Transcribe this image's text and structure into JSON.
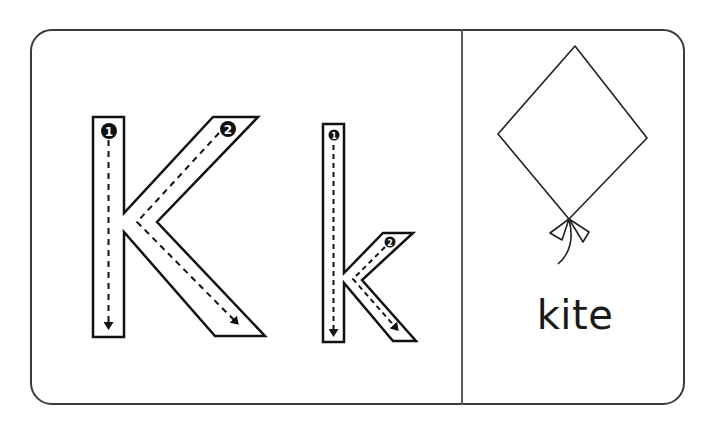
{
  "card": {
    "letters": {
      "uppercase": "K",
      "lowercase": "k"
    },
    "stroke_numbers": {
      "uppercase": [
        "1",
        "2"
      ],
      "lowercase": [
        "1",
        "2"
      ]
    },
    "picture": {
      "icon": "kite-icon",
      "word": "kite"
    }
  },
  "colors": {
    "outline": "#1a1a1a",
    "background": "#ffffff",
    "border": "#3a3a3a"
  }
}
